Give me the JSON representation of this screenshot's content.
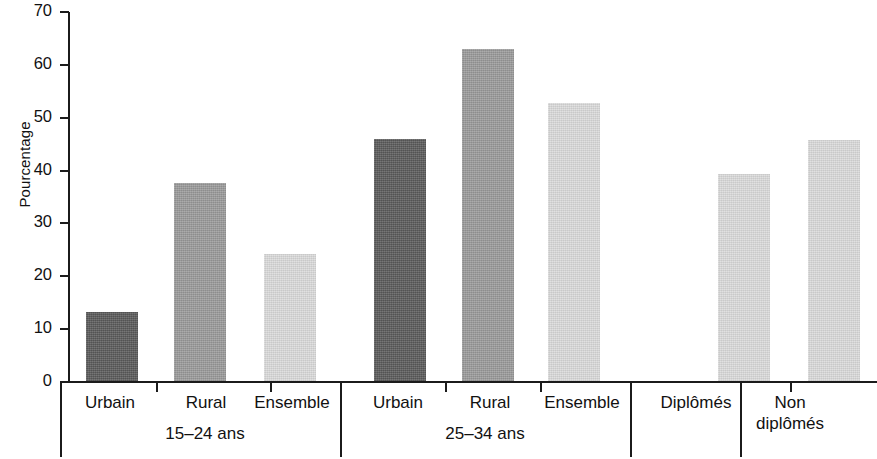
{
  "chart_data": {
    "type": "bar",
    "title": "",
    "subtitle": "",
    "xlabel": "",
    "ylabel": "Pourcentage",
    "ylim": [
      0,
      70
    ],
    "yticks": [
      0,
      10,
      20,
      30,
      40,
      50,
      60,
      70
    ],
    "ytick_labels": [
      "0",
      "10",
      "20",
      "30",
      "40",
      "50",
      "60",
      "70"
    ],
    "grid": false,
    "legend": "none",
    "categories": [
      "Urbain",
      "Rural",
      "Ensemble",
      "Urbain",
      "Rural",
      "Ensemble",
      "Diplômés",
      "Non diplômés"
    ],
    "values": [
      13.2,
      37.6,
      24.3,
      46,
      63,
      52.8,
      39.3,
      45.8
    ],
    "series": [
      {
        "name": "Pourcentage",
        "values": [
          13.2,
          37.6,
          24.3,
          46,
          63,
          52.8,
          39.3,
          45.8
        ]
      }
    ],
    "bars": [
      {
        "label": "Urbain",
        "value": 13.2,
        "shade": "dark",
        "color": "#5a5a5a",
        "group": "15–24 ans"
      },
      {
        "label": "Rural",
        "value": 37.6,
        "shade": "medium",
        "color": "#9a9a9a",
        "group": "15–24 ans"
      },
      {
        "label": "Ensemble",
        "value": 24.3,
        "shade": "light",
        "color": "#dcdcdc",
        "group": "15–24 ans"
      },
      {
        "label": "Urbain",
        "value": 46.0,
        "shade": "dark",
        "color": "#5a5a5a",
        "group": "25–34 ans"
      },
      {
        "label": "Rural",
        "value": 63.0,
        "shade": "medium",
        "color": "#9a9a9a",
        "group": "25–34 ans"
      },
      {
        "label": "Ensemble",
        "value": 52.8,
        "shade": "light",
        "color": "#dcdcdc",
        "group": "25–34 ans"
      },
      {
        "label": "Diplômés",
        "value": 39.3,
        "shade": "light",
        "color": "#dcdcdc",
        "group": ""
      },
      {
        "label": "Non diplômés",
        "value": 45.8,
        "shade": "light",
        "color": "#dcdcdc",
        "group": ""
      }
    ],
    "groups": [
      {
        "label": "15–24 ans"
      },
      {
        "label": "25–34 ans"
      },
      {
        "label": ""
      }
    ]
  },
  "axis": {
    "y_title": "Pourcentage",
    "ticks": [
      {
        "label": "70"
      },
      {
        "label": "60"
      },
      {
        "label": "50"
      },
      {
        "label": "40"
      },
      {
        "label": "30"
      },
      {
        "label": "20"
      },
      {
        "label": "10"
      },
      {
        "label": "0"
      }
    ]
  },
  "category_labels": [
    {
      "text": "Urbain"
    },
    {
      "text": "Rural"
    },
    {
      "text": "Ensemble"
    },
    {
      "text": "Urbain"
    },
    {
      "text": "Rural"
    },
    {
      "text": "Ensemble"
    },
    {
      "text": "Diplômés"
    },
    {
      "text": "Non"
    },
    {
      "text": "diplômés"
    }
  ],
  "group_labels": [
    {
      "text": "15–24 ans"
    },
    {
      "text": "25–34 ans"
    }
  ],
  "colors": {
    "dark": "#5a5a5a",
    "medium": "#9a9a9a",
    "light": "#dcdcdc",
    "axis": "#1b1b1b",
    "background": "#ffffff"
  }
}
